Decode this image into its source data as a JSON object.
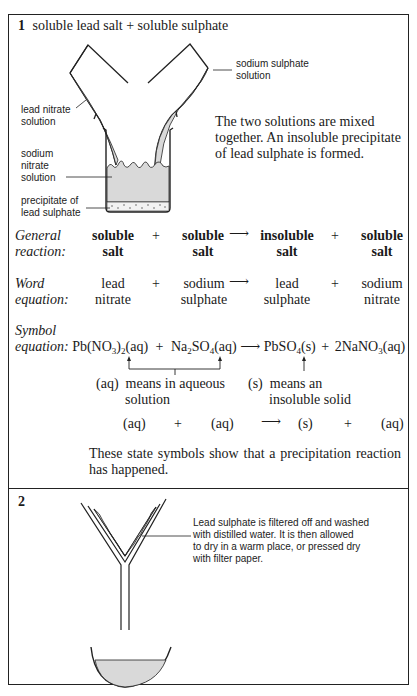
{
  "section1": {
    "number": "1",
    "title": "soluble lead salt + soluble sulphate",
    "diagram_labels": {
      "sodium_sulphate_solution_1": "sodium sulphate",
      "sodium_sulphate_solution_2": "solution",
      "lead_nitrate_solution_1": "lead nitrate",
      "lead_nitrate_solution_2": "solution",
      "sodium_nitrate_solution_1": "sodium",
      "sodium_nitrate_solution_2": "nitrate",
      "sodium_nitrate_solution_3": "solution",
      "precipitate_1": "precipitate of",
      "precipitate_2": "lead sulphate"
    },
    "description_lines": [
      "The two solutions are mixed",
      "together. An insoluble precipitate",
      "of lead sulphate is formed."
    ],
    "general_reaction": {
      "label_1": "General",
      "label_2": "reaction:",
      "terms": [
        {
          "line1": "soluble",
          "line2": "salt"
        },
        {
          "line1": "soluble",
          "line2": "salt"
        },
        {
          "line1": "insoluble",
          "line2": "salt"
        },
        {
          "line1": "soluble",
          "line2": "salt"
        }
      ],
      "plus": "+",
      "arrow": "⟶"
    },
    "word_equation": {
      "label_1": "Word",
      "label_2": "equation:",
      "terms": [
        {
          "line1": "lead",
          "line2": "nitrate"
        },
        {
          "line1": "sodium",
          "line2": "sulphate"
        },
        {
          "line1": "lead",
          "line2": "sulphate"
        },
        {
          "line1": "sodium",
          "line2": "nitrate"
        }
      ],
      "plus": "+",
      "arrow": "⟶"
    },
    "symbol_equation": {
      "label_1": "Symbol",
      "label_2": "equation:",
      "reactant_1": {
        "a": "Pb(NO",
        "sub1": "3",
        "b": ")",
        "sub2": "2",
        "state": "(aq)"
      },
      "reactant_2": {
        "a": "Na",
        "sub1": "2",
        "b": "SO",
        "sub2": "4",
        "state": "(aq)"
      },
      "product_1": {
        "a": "PbSO",
        "sub1": "4",
        "state": "(s)"
      },
      "product_2": {
        "a": "2NaNO",
        "sub1": "3",
        "state": "(aq)"
      },
      "plus": "+",
      "arrow": "⟶",
      "note_aq_1": "(aq)  means in aqueous",
      "note_aq_2": "solution",
      "note_s_1": "(s)  means an",
      "note_s_2": "insoluble solid"
    },
    "state_row": [
      "(aq)",
      "+",
      "(aq)",
      "⟶",
      "(s)",
      "+",
      "(aq)"
    ],
    "state_note_lines": [
      "These state symbols show that a precipitation reaction",
      "has happened."
    ]
  },
  "section2": {
    "number": "2",
    "description_lines": [
      "Lead sulphate is filtered off and washed",
      "with distilled water. It is then allowed",
      "to dry in a warm place, or pressed dry",
      "with filter paper."
    ]
  },
  "colors": {
    "border": "#222222",
    "liquid_fill": "#d9d9d9",
    "text": "#1a1a1a"
  }
}
